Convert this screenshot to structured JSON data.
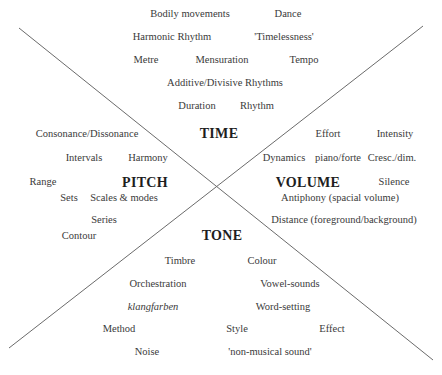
{
  "diagram": {
    "categories": {
      "time": "TIME",
      "pitch": "PITCH",
      "volume": "VOLUME",
      "tone": "TONE"
    },
    "time_terms": {
      "bodily_movements": "Bodily movements",
      "dance": "Dance",
      "harmonic_rhythm": "Harmonic Rhythm",
      "timelessness": "'Timelessness'",
      "metre": "Metre",
      "mensuration": "Mensuration",
      "tempo": "Tempo",
      "additive_divisive": "Additive/Divisive Rhythms",
      "duration": "Duration",
      "rhythm": "Rhythm"
    },
    "pitch_terms": {
      "consonance_dissonance": "Consonance/Dissonance",
      "intervals": "Intervals",
      "harmony": "Harmony",
      "range": "Range",
      "sets": "Sets",
      "scales_modes": "Scales & modes",
      "series": "Series",
      "contour": "Contour"
    },
    "volume_terms": {
      "effort": "Effort",
      "intensity": "Intensity",
      "dynamics": "Dynamics",
      "piano_forte": "piano/forte",
      "cresc_dim": "Cresc./dim.",
      "silence": "Silence",
      "antiphony": "Antiphony (spacial volume)",
      "distance": "Distance (foreground/background)"
    },
    "tone_terms": {
      "timbre": "Timbre",
      "colour": "Colour",
      "orchestration": "Orchestration",
      "vowel_sounds": "Vowel-sounds",
      "klangfarben": "klangfarben",
      "word_setting": "Word-setting",
      "method": "Method",
      "style": "Style",
      "effect": "Effect",
      "noise": "Noise",
      "non_musical_sound": "'non-musical sound'"
    },
    "colors": {
      "line": "#6b6b6b",
      "text": "#3a3a3a",
      "heading": "#1e1e1e"
    }
  }
}
